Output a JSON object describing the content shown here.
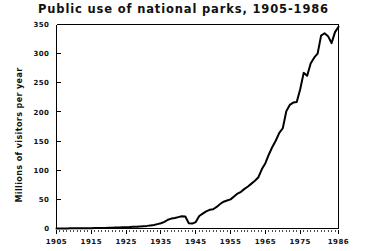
{
  "chart_data": {
    "type": "line",
    "title": "Public use of national parks, 1905-1986",
    "xlabel": "",
    "ylabel": "Millions of visitors per year",
    "xlim": [
      1905,
      1986
    ],
    "ylim": [
      0,
      350
    ],
    "grid": false,
    "legend": null,
    "xticks": [
      "1905",
      "1915",
      "1925",
      "1935",
      "1945",
      "1955",
      "1965",
      "1975",
      "1986"
    ],
    "xtick_values": [
      1905,
      1915,
      1925,
      1935,
      1945,
      1955,
      1965,
      1975,
      1986
    ],
    "yticks": [
      "0",
      "50",
      "100",
      "150",
      "200",
      "250",
      "300",
      "350"
    ],
    "ytick_values": [
      0,
      50,
      100,
      150,
      200,
      250,
      300,
      350
    ],
    "line_color": "#000000",
    "line_width": 2.0,
    "x": [
      1905,
      1906,
      1907,
      1908,
      1909,
      1910,
      1911,
      1912,
      1913,
      1914,
      1915,
      1916,
      1917,
      1918,
      1919,
      1920,
      1921,
      1922,
      1923,
      1924,
      1925,
      1926,
      1927,
      1928,
      1929,
      1930,
      1931,
      1932,
      1933,
      1934,
      1935,
      1936,
      1937,
      1938,
      1939,
      1940,
      1941,
      1942,
      1943,
      1944,
      1945,
      1946,
      1947,
      1948,
      1949,
      1950,
      1951,
      1952,
      1953,
      1954,
      1955,
      1956,
      1957,
      1958,
      1959,
      1960,
      1961,
      1962,
      1963,
      1964,
      1965,
      1966,
      1967,
      1968,
      1969,
      1970,
      1971,
      1972,
      1973,
      1974,
      1975,
      1976,
      1977,
      1978,
      1979,
      1980,
      1981,
      1982,
      1983,
      1984,
      1985,
      1986
    ],
    "values": [
      0.1,
      0.1,
      0.2,
      0.2,
      0.3,
      0.3,
      0.4,
      0.4,
      0.5,
      0.5,
      0.6,
      0.7,
      0.8,
      0.9,
      1.0,
      1.2,
      1.4,
      1.6,
      1.8,
      2.0,
      2.2,
      2.4,
      2.8,
      3.2,
      3.6,
      4.0,
      4.5,
      5.2,
      6.0,
      7.5,
      9.0,
      11.5,
      15.0,
      17.0,
      18.0,
      19.5,
      21.0,
      20.5,
      9.0,
      8.5,
      11.0,
      21.5,
      25.5,
      29.5,
      32.0,
      33.0,
      37.0,
      42.0,
      46.0,
      48.0,
      50.0,
      55.0,
      60.0,
      63.0,
      68.0,
      72.0,
      77.0,
      82.0,
      88.0,
      102.0,
      112.0,
      127.0,
      140.0,
      151.0,
      164.0,
      172.0,
      201.0,
      212.0,
      216.0,
      217.0,
      239.0,
      267.0,
      262.0,
      283.0,
      293.0,
      300.0,
      331.0,
      335.0,
      330.0,
      318.0,
      337.0,
      346.0
    ]
  },
  "axes": {
    "ylabel_text": "Millions of visitors per year"
  }
}
